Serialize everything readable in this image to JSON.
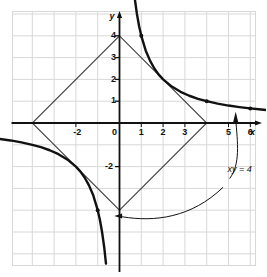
{
  "figure": {
    "background_color": "#ffffff",
    "grid_color": "#d8d8d8",
    "axis_color": "#111111",
    "curve_color": "#111111",
    "diamond_color": "#444444"
  },
  "axes": {
    "x_name": "x",
    "y_name": "y",
    "x_ticks": [
      {
        "value": -2,
        "label": "-2"
      },
      {
        "value": 0,
        "label": "0"
      },
      {
        "value": 1,
        "label": "1"
      },
      {
        "value": 2,
        "label": "2"
      },
      {
        "value": 3,
        "label": "3"
      },
      {
        "value": 5,
        "label": "5"
      },
      {
        "value": 6,
        "label": "6"
      },
      {
        "value": 7,
        "label": "7"
      },
      {
        "value": 8,
        "label": "8"
      }
    ],
    "y_ticks": [
      {
        "value": 4,
        "label": "4"
      },
      {
        "value": 3,
        "label": "3"
      },
      {
        "value": 2,
        "label": "2"
      },
      {
        "value": 1,
        "label": "1"
      },
      {
        "value": -2,
        "label": "-2"
      }
    ],
    "xlim": [
      -5,
      9
    ],
    "ylim": [
      -5.5,
      6.5
    ],
    "grid": true
  },
  "annotations": {
    "curve_label": "xy = 4"
  },
  "chart_data": {
    "type": "line",
    "title": "xy = 4",
    "xlabel": "x",
    "ylabel": "y",
    "xlim": [
      -5,
      9
    ],
    "ylim": [
      -5.5,
      6.5
    ],
    "grid": true,
    "legend": "none",
    "series": [
      {
        "name": "xy = 4 (branch 1, x > 0)",
        "equation": "y = 4/x",
        "x": [
          0.62,
          0.7,
          0.8,
          0.9,
          1.0,
          1.2,
          1.4,
          1.6,
          1.8,
          2.0,
          2.4,
          2.8,
          3.2,
          3.6,
          4.0,
          4.5,
          5.0,
          5.5,
          6.0,
          6.5,
          7.0,
          7.5,
          8.0,
          8.6
        ],
        "y": [
          6.45,
          5.71,
          5.0,
          4.44,
          4.0,
          3.33,
          2.86,
          2.5,
          2.22,
          2.0,
          1.67,
          1.43,
          1.25,
          1.11,
          1.0,
          0.89,
          0.8,
          0.73,
          0.67,
          0.62,
          0.57,
          0.53,
          0.5,
          0.47
        ],
        "markers": [
          {
            "x": 1.0,
            "y": 4.0
          },
          {
            "x": 4.0,
            "y": 1.0
          },
          {
            "x": 6.0,
            "y": 0.67
          },
          {
            "x": 8.0,
            "y": 0.5
          }
        ]
      },
      {
        "name": "xy = 4 (branch 2, x < 0)",
        "equation": "y = 4/x",
        "x": [
          -8.6,
          -8.0,
          -7.5,
          -7.0,
          -6.5,
          -6.0,
          -5.5,
          -5.0,
          -4.5,
          -4.0,
          -3.6,
          -3.2,
          -2.8,
          -2.4,
          -2.0,
          -1.8,
          -1.6,
          -1.4,
          -1.2,
          -1.0,
          -0.9,
          -0.8,
          -0.7,
          -0.62
        ],
        "y": [
          -0.47,
          -0.5,
          -0.53,
          -0.57,
          -0.62,
          -0.67,
          -0.73,
          -0.8,
          -0.89,
          -1.0,
          -1.11,
          -1.25,
          -1.43,
          -1.67,
          -2.0,
          -2.22,
          -2.5,
          -2.86,
          -3.33,
          -4.0,
          -4.44,
          -5.0,
          -5.71,
          -6.45
        ],
        "markers": [
          {
            "x": -8.0,
            "y": -0.5
          },
          {
            "x": -6.0,
            "y": -0.67
          },
          {
            "x": -1.0,
            "y": -4.0
          }
        ]
      },
      {
        "name": "|x| + |y| = 4 (diamond)",
        "equation": "|x| + |y| = 4",
        "x": [
          0,
          4,
          0,
          -4,
          0
        ],
        "y": [
          4,
          0,
          -4,
          0,
          4
        ],
        "vertices": [
          {
            "x": 0,
            "y": 4
          },
          {
            "x": 4,
            "y": 0
          },
          {
            "x": 0,
            "y": -4
          },
          {
            "x": -4,
            "y": 0
          }
        ]
      }
    ],
    "annotations": [
      {
        "text": "xy = 4",
        "x": 5.1,
        "y": -2.1,
        "points_to": [
          {
            "x": 5.35,
            "y": 0.4
          },
          {
            "x": -0.35,
            "y": -4.25
          }
        ]
      }
    ]
  }
}
